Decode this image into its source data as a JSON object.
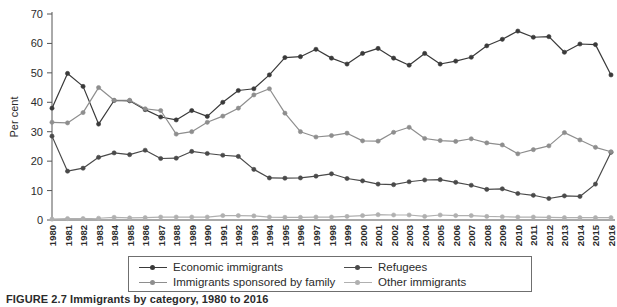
{
  "figure": {
    "caption": "FIGURE 2.7  Immigrants by category, 1980 to 2016"
  },
  "axes": {
    "ylabel": "Per cent",
    "yticks": [
      "0",
      "10",
      "20",
      "30",
      "40",
      "50",
      "60",
      "70"
    ],
    "ylim": [
      0,
      70
    ],
    "xlabel": ""
  },
  "legend": {
    "items": [
      {
        "label": "Economic immigrants",
        "color": "#3a3a3a",
        "marker": "circle"
      },
      {
        "label": "Refugees",
        "color": "#4a4a4a",
        "marker": "circle"
      },
      {
        "label": "Immigrants sponsored by family",
        "color": "#8e8e8e",
        "marker": "circle"
      },
      {
        "label": "Other immigrants",
        "color": "#b0b0b0",
        "marker": "circle"
      }
    ]
  },
  "chart_data": {
    "type": "line",
    "title": "Immigrants by category, 1980 to 2016",
    "xlabel": "",
    "ylabel": "Per cent",
    "ylim": [
      0,
      70
    ],
    "grid": false,
    "legend_position": "bottom",
    "categories": [
      "1980",
      "1981",
      "1982",
      "1983",
      "1984",
      "1985",
      "1986",
      "1987",
      "1988",
      "1989",
      "1990",
      "1991",
      "1992",
      "1993",
      "1994",
      "1995",
      "1996",
      "1997",
      "1998",
      "1999",
      "2000",
      "2001",
      "2002",
      "2003",
      "2004",
      "2005",
      "2006",
      "2007",
      "2008",
      "2009",
      "2010",
      "2011",
      "2012",
      "2013",
      "2014",
      "2015",
      "2016"
    ],
    "series": [
      {
        "name": "Economic immigrants",
        "color": "#3a3a3a",
        "values": [
          38.0,
          49.8,
          45.4,
          32.6,
          40.6,
          40.5,
          37.5,
          35.0,
          34.0,
          37.2,
          35.2,
          40.0,
          44.0,
          44.6,
          49.3,
          55.2,
          55.5,
          58.0,
          55.0,
          53.0,
          56.6,
          58.3,
          55.0,
          52.6,
          56.6,
          53.0,
          54.0,
          55.3,
          59.2,
          61.4,
          64.2,
          62.1,
          62.3,
          57.0,
          59.8,
          59.6,
          49.3
        ]
      },
      {
        "name": "Refugees",
        "color": "#4a4a4a",
        "values": [
          28.5,
          16.6,
          17.6,
          21.3,
          22.8,
          22.2,
          23.7,
          20.9,
          21.0,
          23.3,
          22.6,
          22.0,
          21.6,
          17.2,
          14.3,
          14.2,
          14.3,
          14.9,
          15.7,
          14.1,
          13.3,
          12.2,
          12.0,
          13.0,
          13.6,
          13.7,
          12.8,
          11.8,
          10.4,
          10.6,
          9.0,
          8.4,
          7.3,
          8.2,
          8.0,
          12.2,
          23.0
        ]
      },
      {
        "name": "Immigrants sponsored by family",
        "color": "#8e8e8e",
        "values": [
          33.2,
          33.0,
          36.5,
          45.0,
          40.7,
          40.7,
          37.8,
          37.2,
          29.2,
          30.0,
          33.2,
          35.3,
          38.0,
          42.5,
          44.6,
          36.3,
          30.0,
          28.2,
          28.7,
          29.5,
          26.9,
          26.8,
          29.8,
          31.5,
          27.7,
          27.0,
          26.7,
          27.6,
          26.2,
          25.5,
          22.5,
          23.9,
          25.2,
          29.7,
          27.2,
          24.7,
          23.2
        ]
      },
      {
        "name": "Other immigrants",
        "color": "#b0b0b0",
        "values": [
          0.3,
          0.5,
          0.5,
          0.6,
          0.9,
          0.7,
          0.8,
          1.0,
          1.0,
          1.0,
          1.0,
          1.5,
          1.5,
          1.4,
          1.0,
          0.9,
          0.9,
          1.0,
          1.0,
          1.2,
          1.5,
          1.8,
          1.7,
          1.7,
          1.2,
          1.7,
          1.5,
          1.5,
          1.2,
          1.1,
          1.0,
          1.0,
          0.9,
          0.8,
          0.8,
          0.8,
          0.8
        ]
      }
    ]
  }
}
